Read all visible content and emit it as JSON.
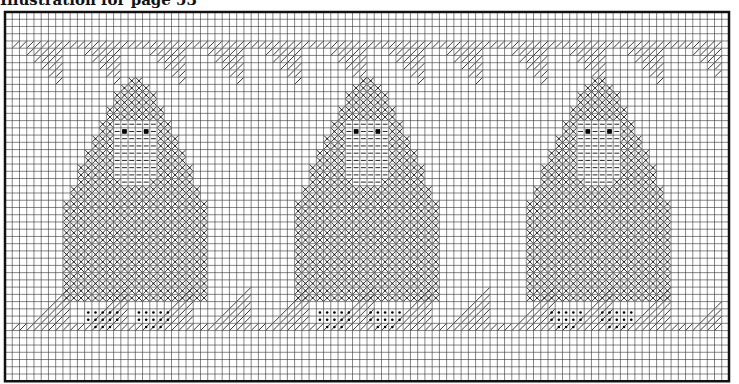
{
  "caption": "Illustration for page 53",
  "chart": {
    "origin_x": 5,
    "origin_y": 12,
    "cols": 100,
    "rows": 51,
    "cell": 7.24,
    "grid_color": "#333333",
    "border_color": "#111111",
    "stitch_color": "#222222"
  },
  "legend_symbols": {
    "X": "cross-stitch (gnome hat & body)",
    "-": "dash stitch (beard)",
    "E": "eye (filled square)",
    "o": "dot stitch (shoes)",
    "/": "diagonal half-stitch (border bands)"
  },
  "gnomes": [
    {
      "label": "gnome-1",
      "center_col": 17
    },
    {
      "label": "gnome-2",
      "center_col": 49
    },
    {
      "label": "gnome-3",
      "center_col": 81
    }
  ],
  "gnome_pattern": [
    "         XX         ",
    "        XXXX        ",
    "       XXXXXX       ",
    "       XXXXXX       ",
    "      XXXXXXXX      ",
    "      XXXXXXXX      ",
    "     XX------XX     ",
    "     XX-E--E-XX     ",
    "    XXX------XXX    ",
    "    XXX------XXX    ",
    "   XXXX------XXXX   ",
    "   XXXX------XXXX   ",
    "  XXXXX------XXXXX  ",
    "  XXXXX------XXXXX  ",
    "  XXXXXX----XXXXXX  ",
    " XXXXXXXXXXXXXXXXXX ",
    " XXXXXXXXXXXXXXXXXX ",
    "XXXXXXXXXXXXXXXXXXXX",
    "XXXXXXXXXXXXXXXXXXXX",
    "XXXXXXXXXXXXXXXXXXXX",
    "XXXXXXXXXXXXXXXXXXXX",
    "XXXXXXXXXXXXXXXXXXXX",
    "XXXXXXXXXXXXXXXXXXXX",
    "XXXXXXXXXXXXXXXXXXXX",
    "XXXXXXXXXXXXXXXXXXXX",
    "XXXXXXXXXXXXXXXXXXXX",
    "XXXXXXXXXXXXXXXXXXXX",
    "XXXXXXXXXXXXXXXXXXXX",
    "XXXXXXXXXXXXXXXXXXXX",
    "XXXXXXXXXXXXXXXXXXXX",
    "XXXXXXXXXXXXXXXXXXXX",
    "                    ",
    "   ooooo  ooooo     ",
    "   ooooo  ooooo     ",
    "    ooo    ooo      "
  ],
  "gnome_top_row": 9,
  "top_band": {
    "full_row": 4,
    "triangle_period": 8.33,
    "triangle_offset": 2,
    "depth": 5
  },
  "bottom_band": {
    "full_row": 43,
    "triangle_period": 8.33,
    "triangle_offset": 3,
    "height": 5
  }
}
